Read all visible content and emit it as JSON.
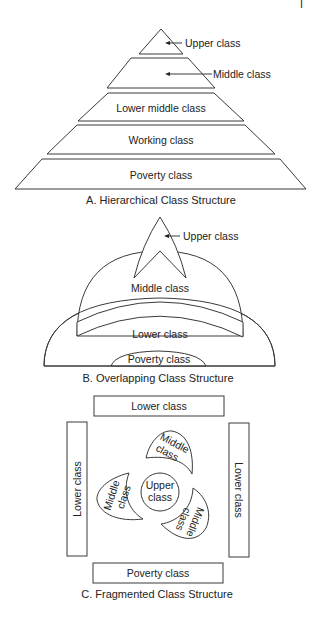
{
  "page_number_mark": "I",
  "diagram_a": {
    "caption": "A. Hierarchical Class Structure",
    "layers": [
      {
        "label": "Upper class",
        "callout": true
      },
      {
        "label": "Middle class",
        "callout": true
      },
      {
        "label": "Lower middle class",
        "callout": false
      },
      {
        "label": "Working class",
        "callout": false
      },
      {
        "label": "Poverty class",
        "callout": false
      }
    ]
  },
  "diagram_b": {
    "caption": "B. Overlapping Class Structure",
    "regions": {
      "upper": "Upper class",
      "middle": "Middle class",
      "lower": "Lower class",
      "poverty": "Poverty class"
    }
  },
  "diagram_c": {
    "caption": "C. Fragmented Class Structure",
    "top_box": "Lower class",
    "left_box": "Lower class",
    "right_box": "Lower class",
    "bottom_box": "Poverty class",
    "center": {
      "line1": "Upper",
      "line2": "class"
    },
    "petals": [
      {
        "line1": "Middle",
        "line2": "class"
      },
      {
        "line1": "Middle",
        "line2": "class"
      },
      {
        "line1": "Middle",
        "line2": "class"
      }
    ]
  },
  "colors": {
    "stroke": "#3a3a3a",
    "text": "#222222",
    "background": "#ffffff"
  }
}
